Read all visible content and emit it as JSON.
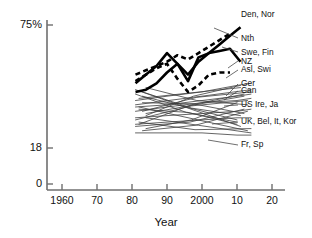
{
  "chart_data": {
    "type": "line",
    "title": "",
    "subtitle": "",
    "xlabel": "Year",
    "ylabel": "",
    "grid": false,
    "legend_position": "right-inline-labels",
    "xlim": [
      1960,
      2020
    ],
    "ylim": [
      0,
      75
    ],
    "y_axis_note": "Non-linear / compressed axis: ticks shown at 0, 18 and 75%",
    "x_ticks": [
      {
        "value": 1960,
        "label": "1960"
      },
      {
        "value": 1970,
        "label": "70"
      },
      {
        "value": 1980,
        "label": "80"
      },
      {
        "value": 1990,
        "label": "90"
      },
      {
        "value": 2000,
        "label": "2000"
      },
      {
        "value": 2010,
        "label": "10"
      },
      {
        "value": 2020,
        "label": "20"
      }
    ],
    "y_ticks": [
      {
        "value": 0,
        "label": "0"
      },
      {
        "value": 18,
        "label": "18"
      },
      {
        "value": 75,
        "label": "75%"
      }
    ],
    "series": [
      {
        "name": "Den, Nor",
        "label": "Den, Nor",
        "style": "thick-solid",
        "emphasis": true,
        "x": [
          1981,
          1984,
          1987,
          1990,
          1993,
          1996,
          1999,
          2002,
          2005,
          2008,
          2011
        ],
        "values": [
          44,
          45,
          48,
          53,
          57,
          52,
          58,
          62,
          66,
          70,
          74
        ]
      },
      {
        "name": "Nth",
        "label": "Nth",
        "style": "thick-dashed",
        "emphasis": true,
        "x": [
          1981,
          1984,
          1987,
          1990,
          1993,
          1996,
          1999,
          2002,
          2005,
          2008
        ],
        "values": [
          52,
          54,
          56,
          58,
          61,
          59,
          62,
          65,
          68,
          71
        ]
      },
      {
        "name": "Swe, Fin",
        "label": "Swe, Fin",
        "style": "thick-solid",
        "emphasis": true,
        "x": [
          1981,
          1984,
          1987,
          1990,
          1993,
          1996,
          1999,
          2002,
          2005,
          2008,
          2011
        ],
        "values": [
          48,
          52,
          56,
          62,
          57,
          49,
          60,
          62,
          63,
          64,
          58
        ]
      },
      {
        "name": "NZ",
        "label": "NZ",
        "style": "thick-dashed",
        "emphasis": true,
        "x": [
          1981,
          1984,
          1987,
          1990,
          1993,
          1996,
          1999,
          2002,
          2005,
          2008
        ],
        "values": [
          49,
          52,
          55,
          57,
          50,
          44,
          47,
          52,
          53,
          53
        ]
      },
      {
        "name": "Asl, Swi",
        "label": "Asl, Swi",
        "style": "thin-solid",
        "emphasis": false,
        "x": [
          1981,
          1990,
          2000,
          2010,
          2014
        ],
        "values": [
          40,
          42,
          44,
          47,
          48
        ]
      },
      {
        "name": "Ger",
        "label": "Ger",
        "style": "thin-solid",
        "emphasis": false,
        "x": [
          1981,
          1990,
          2000,
          2010,
          2014
        ],
        "values": [
          37,
          38,
          40,
          42,
          43
        ]
      },
      {
        "name": "Can",
        "label": "Can",
        "style": "thin-solid",
        "emphasis": false,
        "x": [
          1981,
          1990,
          2000,
          2010,
          2014
        ],
        "values": [
          35,
          37,
          39,
          40,
          41
        ]
      },
      {
        "name": "US Ire, Ja",
        "label": "US Ire, Ja",
        "style": "thin-solid",
        "emphasis": false,
        "x": [
          1981,
          1990,
          2000,
          2010,
          2014
        ],
        "values": [
          32,
          33,
          34,
          35,
          36
        ]
      },
      {
        "name": "UK, Bel, It, Kor",
        "label": "UK, Bel, It, Kor",
        "style": "thin-solid",
        "emphasis": false,
        "x": [
          1981,
          1990,
          2000,
          2010,
          2014
        ],
        "values": [
          29,
          30,
          31,
          32,
          32
        ]
      },
      {
        "name": "Fr, Sp",
        "label": "Fr, Sp",
        "style": "thin-solid",
        "emphasis": false,
        "x": [
          1981,
          1990,
          2000,
          2010,
          2014
        ],
        "values": [
          25,
          25,
          25,
          24,
          24
        ]
      }
    ],
    "labels": [
      {
        "text": "Den, Nor",
        "x": 241,
        "y": 15
      },
      {
        "text": "Nth",
        "x": 241,
        "y": 39
      },
      {
        "text": "Swe, Fin",
        "x": 241,
        "y": 53
      },
      {
        "text": "NZ",
        "x": 241,
        "y": 62
      },
      {
        "text": "Asl, Swi",
        "x": 241,
        "y": 70
      },
      {
        "text": "Ger",
        "x": 241,
        "y": 84
      },
      {
        "text": "Can",
        "x": 241,
        "y": 91
      },
      {
        "text": "US Ire, Ja",
        "x": 241,
        "y": 105
      },
      {
        "text": "UK, Bel, It, Kor",
        "x": 241,
        "y": 122
      },
      {
        "text": "Fr, Sp",
        "x": 241,
        "y": 145
      }
    ],
    "colors": {
      "axis": "#6f6f6f",
      "thin_series": "#3d3d3d",
      "emphasis_series": "#000000",
      "background": "#ffffff",
      "text": "#111111"
    }
  }
}
